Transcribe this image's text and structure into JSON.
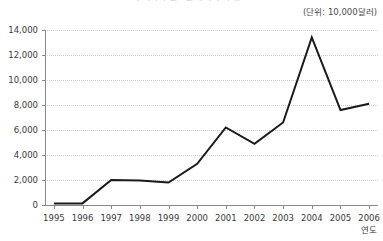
{
  "chart_data": {
    "type": "line",
    "title": "우리나라 연도별 해외 투자 규모",
    "unit_note": "(단위: 10,000달러)",
    "xlabel": "연도",
    "ylabel": "",
    "categories": [
      "1995",
      "1996",
      "1997",
      "1998",
      "1999",
      "2000",
      "2001",
      "2002",
      "2003",
      "2004",
      "2005",
      "2006"
    ],
    "values": [
      120,
      130,
      2000,
      1950,
      1800,
      3300,
      6200,
      4900,
      6600,
      13400,
      7600,
      8100
    ],
    "series": [
      {
        "name": "해외 투자 규모",
        "values": [
          120,
          130,
          2000,
          1950,
          1800,
          3300,
          6200,
          4900,
          6600,
          13400,
          7600,
          8100
        ]
      }
    ],
    "ylim": [
      0,
      14000
    ],
    "ytick_labels": [
      "0",
      "2,000",
      "4,000",
      "6,000",
      "8,000",
      "10,000",
      "12,000",
      "14,000"
    ],
    "ytick_values": [
      0,
      2000,
      4000,
      6000,
      8000,
      10000,
      12000,
      14000
    ],
    "grid": "horizontal-dotted",
    "legend": "none",
    "line_color": "#1a1a1a",
    "grid_color": "#d0d0d0",
    "axis_color": "#8a8a8a",
    "background_color": "#ffffff"
  }
}
